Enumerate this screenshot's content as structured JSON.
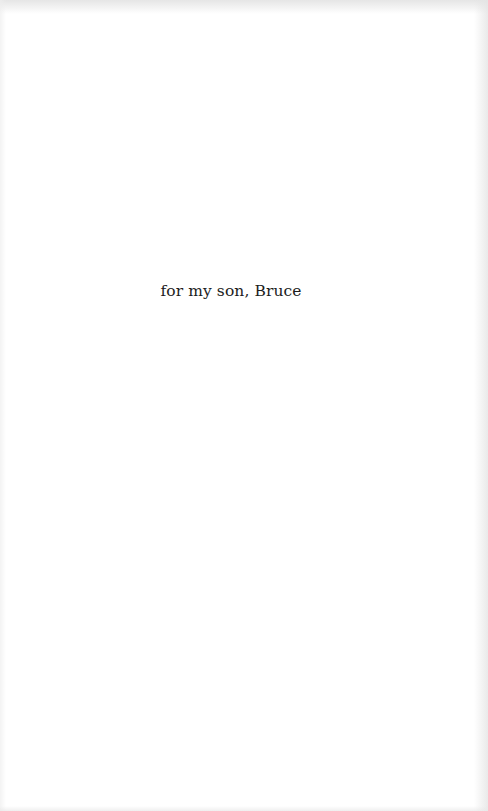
{
  "page": {
    "type": "dedication",
    "dedication_text": "for my son, Bruce"
  },
  "colors": {
    "background": "#ffffff",
    "text": "#1c1c1c",
    "edge_shading": "#e4e4e4"
  }
}
